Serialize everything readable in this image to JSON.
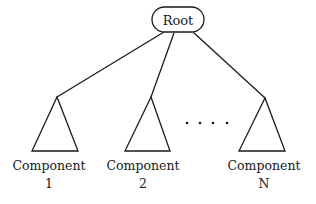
{
  "diagram": {
    "type": "tree",
    "root": {
      "label": "Root"
    },
    "children": [
      {
        "label": "Component",
        "index": "1"
      },
      {
        "label": "Component",
        "index": "2"
      },
      {
        "label": "Component",
        "index": "N"
      }
    ],
    "ellipsis": "....",
    "colors": {
      "stroke": "#1a1a1a",
      "background": "#ffffff"
    }
  }
}
